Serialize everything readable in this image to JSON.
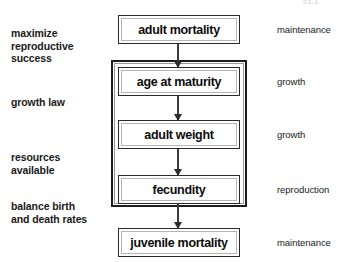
{
  "diagram": {
    "type": "flowchart",
    "artifact_text": "51.1",
    "nodes": [
      {
        "id": "adult-mortality",
        "label": "adult mortality",
        "right_label": "maintenance"
      },
      {
        "id": "age-at-maturity",
        "label": "age at maturity",
        "right_label": "growth"
      },
      {
        "id": "adult-weight",
        "label": "adult weight",
        "right_label": "growth"
      },
      {
        "id": "fecundity",
        "label": "fecundity",
        "right_label": "reproduction"
      },
      {
        "id": "juvenile-mortality",
        "label": "juvenile mortality",
        "right_label": "maintenance"
      }
    ],
    "left_labels": [
      {
        "id": "maximize-reproductive-success",
        "text": "maximize\nreproductive\nsuccess"
      },
      {
        "id": "growth-law",
        "text": "growth law"
      },
      {
        "id": "resources-available",
        "text": "resources\navailable"
      },
      {
        "id": "balance-birth-and-death-rates",
        "text": "balance birth\nand death rates"
      }
    ],
    "arrows": [
      {
        "from": "adult-mortality",
        "to": "age-at-maturity",
        "direction": "down"
      },
      {
        "from": "age-at-maturity",
        "to": "adult-weight",
        "direction": "down"
      },
      {
        "from": "adult-weight",
        "to": "fecundity",
        "direction": "down"
      },
      {
        "from": "fecundity",
        "to": "juvenile-mortality",
        "direction": "down"
      }
    ],
    "group_box": {
      "id": "growth-reproduction-group",
      "contains": [
        "age-at-maturity",
        "adult-weight",
        "fecundity"
      ]
    },
    "colors": {
      "background": "#ffffff",
      "box_border": "#2a2a2a",
      "group_border": "#1c1c1c",
      "arrow": "#2b2b2b",
      "text": "#0c0c0c"
    }
  }
}
